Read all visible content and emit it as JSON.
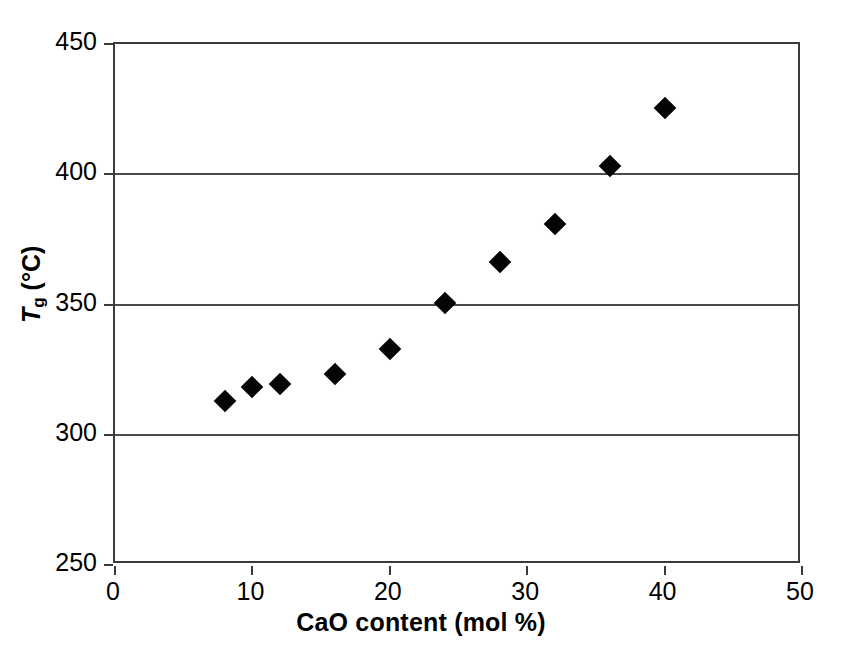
{
  "chart_data": {
    "type": "scatter",
    "title": "",
    "xlabel": "CaO content (mol %)",
    "ylabel": "Tg (°C)",
    "ylabel_parts": {
      "symbol": "T",
      "subscript": "g",
      "units": "(°C)"
    },
    "xlim": [
      0,
      50
    ],
    "ylim": [
      250,
      450
    ],
    "xticks": [
      0,
      10,
      20,
      30,
      40,
      50
    ],
    "xtick_labels": [
      "0",
      "10",
      "20",
      "30",
      "40",
      "50"
    ],
    "yticks": [
      250,
      300,
      350,
      400,
      450
    ],
    "ytick_labels": [
      "250",
      "300",
      "350",
      "400",
      "450"
    ],
    "gridlines_y": [
      300,
      350,
      400
    ],
    "grid": "horizontal",
    "legend": null,
    "marker": "diamond",
    "marker_color": "#050505",
    "x": [
      8,
      10,
      12,
      16,
      20,
      24,
      28,
      32,
      36,
      40
    ],
    "y": [
      313,
      318.5,
      319.5,
      323.5,
      333,
      350.5,
      366.5,
      381,
      403,
      425.5
    ],
    "points": [
      {
        "x": 8,
        "y": 313
      },
      {
        "x": 10,
        "y": 318.5
      },
      {
        "x": 12,
        "y": 319.5
      },
      {
        "x": 16,
        "y": 323.5
      },
      {
        "x": 20,
        "y": 333
      },
      {
        "x": 24,
        "y": 350.5
      },
      {
        "x": 28,
        "y": 366.5
      },
      {
        "x": 32,
        "y": 381
      },
      {
        "x": 36,
        "y": 403
      },
      {
        "x": 40,
        "y": 425.5
      }
    ]
  },
  "style": {
    "background": "#ffffff",
    "axis_color": "#3a3a3a",
    "grid_color": "#4a4a4a"
  }
}
